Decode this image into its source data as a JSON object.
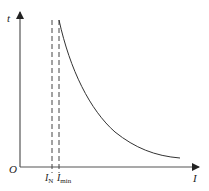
{
  "diagram": {
    "type": "inverse-time current characteristic",
    "axes": {
      "y_label": "t",
      "x_label": "I",
      "origin_label": "O"
    },
    "markers": [
      {
        "label_main": "I",
        "label_sub": "N",
        "style": "dashed"
      },
      {
        "label_main": "I",
        "label_sub": "min",
        "style": "dashed"
      }
    ],
    "curve": {
      "description": "decreasing hyperbolic-like curve starting at I_min, approaching horizontal asymptote"
    },
    "colors": {
      "line": "#333333",
      "background": "#ffffff"
    }
  }
}
